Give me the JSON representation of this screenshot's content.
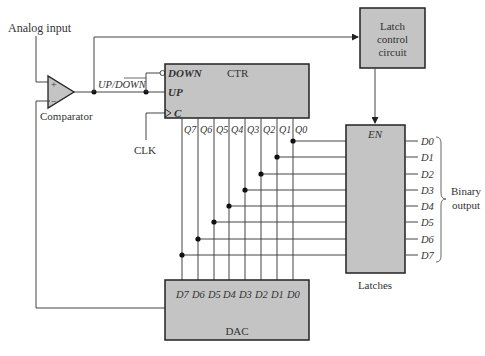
{
  "labels": {
    "analog_input": "Analog input",
    "comparator": "Comparator",
    "plus": "+",
    "minus": "−",
    "up_down": "UP/DOWN",
    "clk": "CLK",
    "latches": "Latches",
    "binary_output_line1": "Binary",
    "binary_output_line2": "output"
  },
  "counter": {
    "title": "CTR",
    "down": "DOWN",
    "up": "UP",
    "clock": "C",
    "outputs": [
      "Q7",
      "Q6",
      "Q5",
      "Q4",
      "Q3",
      "Q2",
      "Q1",
      "Q0"
    ]
  },
  "latch_control": {
    "line1": "Latch",
    "line2": "control",
    "line3": "circuit"
  },
  "latch_block": {
    "enable": "EN",
    "outputs": [
      "D0",
      "D1",
      "D2",
      "D3",
      "D4",
      "D5",
      "D6",
      "D7"
    ]
  },
  "dac": {
    "title": "DAC",
    "inputs": [
      "D7",
      "D6",
      "D5",
      "D4",
      "D3",
      "D2",
      "D1",
      "D0"
    ]
  },
  "colors": {
    "block_fill": "#c4c4c4",
    "line": "#444444",
    "text": "#333333"
  }
}
